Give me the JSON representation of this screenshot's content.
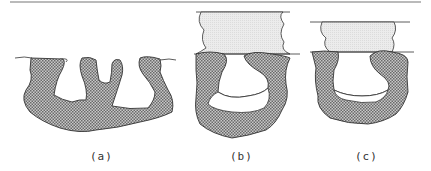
{
  "figure": {
    "panels": [
      {
        "id": "a",
        "label": "(a)"
      },
      {
        "id": "b",
        "label": "(b)"
      },
      {
        "id": "c",
        "label": "(c)"
      }
    ],
    "colors": {
      "substrate": "#9a9a9a",
      "filler": "#e8e8e8",
      "line": "#333333"
    }
  }
}
